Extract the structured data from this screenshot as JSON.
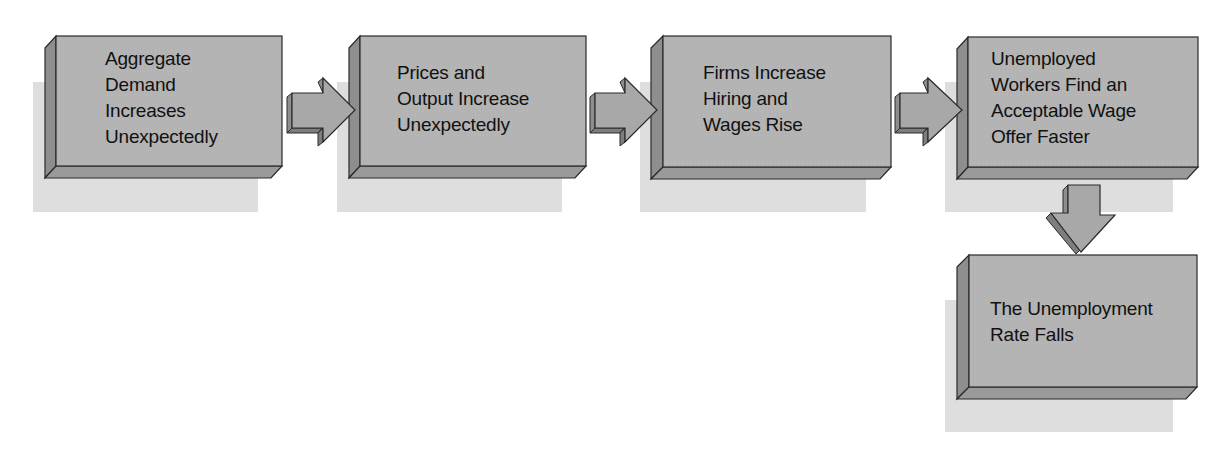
{
  "diagram": {
    "type": "flowchart",
    "colors": {
      "face": "#b4b4b4",
      "bevel_left": "#8e8e8e",
      "bevel_bottom": "#9a9a9a",
      "shadow": "#dedede",
      "border": "#2a2a2a",
      "text": "#111111"
    },
    "nodes": [
      {
        "id": "n1",
        "lines": [
          "Aggregate",
          "Demand",
          "Increases",
          "Unexpectedly"
        ]
      },
      {
        "id": "n2",
        "lines": [
          "Prices and",
          "Output Increase",
          "Unexpectedly"
        ]
      },
      {
        "id": "n3",
        "lines": [
          "Firms Increase",
          "Hiring and",
          "Wages Rise"
        ]
      },
      {
        "id": "n4",
        "lines": [
          "Unemployed",
          "Workers Find an",
          "Acceptable Wage",
          "Offer Faster"
        ]
      },
      {
        "id": "n5",
        "lines": [
          "The Unemployment",
          "Rate Falls"
        ]
      }
    ],
    "edges": [
      {
        "from": "n1",
        "to": "n2",
        "direction": "right"
      },
      {
        "from": "n2",
        "to": "n3",
        "direction": "right"
      },
      {
        "from": "n3",
        "to": "n4",
        "direction": "right"
      },
      {
        "from": "n4",
        "to": "n5",
        "direction": "down"
      }
    ]
  }
}
